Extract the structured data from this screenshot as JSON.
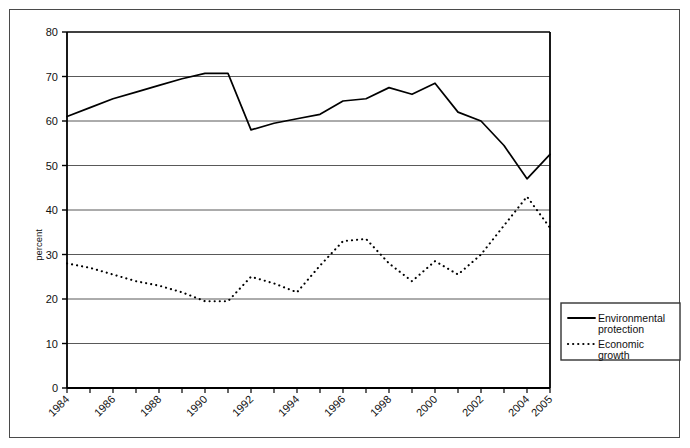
{
  "figure": {
    "background_color": "#ffffff",
    "border_color": "#4a4a4a",
    "line_color": "#000000",
    "grid_color": "#595959"
  },
  "axes": {
    "y_axis_title": "percent",
    "y_ticks": [
      "0",
      "10",
      "20",
      "30",
      "40",
      "50",
      "60",
      "70",
      "80"
    ],
    "x_ticks_labeled": [
      "1984",
      "1986",
      "1988",
      "1990",
      "1992",
      "1994",
      "1996",
      "1998",
      "2000",
      "2002",
      "2004",
      "2005"
    ]
  },
  "legend": {
    "items": [
      {
        "label_line1": "Environmental",
        "label_line2": "protection",
        "style": "solid"
      },
      {
        "label_line1": "Economic",
        "label_line2": "growth",
        "style": "dotted"
      }
    ]
  },
  "chart_data": {
    "type": "line",
    "title": "",
    "xlabel": "",
    "ylabel": "percent",
    "ylim": [
      0,
      80
    ],
    "ytick_step": 10,
    "grid": true,
    "legend_position": "right-outside-lower",
    "x": [
      "1984",
      "1985",
      "1986",
      "1987",
      "1988",
      "1989",
      "1990",
      "1991",
      "1992",
      "1993",
      "1994",
      "1995",
      "1996",
      "1997",
      "1998",
      "1999",
      "2000",
      "2001",
      "2002",
      "2003",
      "2004",
      "2005"
    ],
    "x_tick_labels": [
      "1984",
      "",
      "1986",
      "",
      "1988",
      "",
      "1990",
      "",
      "1992",
      "",
      "1994",
      "",
      "1996",
      "",
      "1998",
      "",
      "2000",
      "",
      "2002",
      "",
      "2004",
      "2005"
    ],
    "series": [
      {
        "name": "Environmental protection",
        "style": "solid",
        "values": [
          61,
          63,
          65,
          66.5,
          68,
          69.5,
          70.7,
          70.7,
          58,
          59.5,
          60.5,
          61.5,
          64.5,
          65,
          67.5,
          66,
          68.5,
          62,
          60,
          54.5,
          47,
          52.5
        ]
      },
      {
        "name": "Economic growth",
        "style": "dotted",
        "values": [
          28,
          27,
          25.5,
          24,
          23,
          21.5,
          19.5,
          19.5,
          25,
          23.5,
          21.5,
          27.5,
          33,
          33.5,
          28,
          24,
          28.5,
          25.5,
          30,
          36.5,
          43,
          36
        ]
      }
    ]
  }
}
